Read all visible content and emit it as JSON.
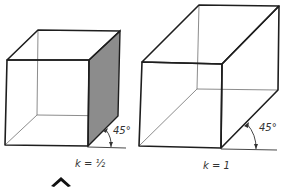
{
  "figures": [
    {
      "id": "cube-left",
      "label": "k = ½",
      "angle_label": "45°",
      "shaded_side": true,
      "shade_color": "#8c8c8c"
    },
    {
      "id": "box-right",
      "label": "k = 1",
      "angle_label": "45°",
      "shaded_side": false
    }
  ],
  "marker": {
    "icon": "chevron-up-icon"
  }
}
